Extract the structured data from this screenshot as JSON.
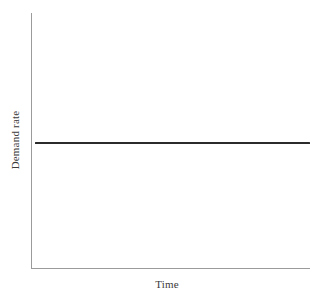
{
  "figure": {
    "background_color": "#ffffff",
    "axis_color": "#9b9b9b",
    "series_color": "#2b2b2b"
  },
  "axes": {
    "x_title": "Time",
    "y_title": "Demand rate"
  },
  "chart_data": {
    "type": "line",
    "title": "",
    "subtitle": "",
    "xlabel": "Time",
    "ylabel": "Demand rate",
    "xlim": [
      0,
      1
    ],
    "ylim": [
      0,
      1
    ],
    "x_tick_labels": [],
    "y_tick_labels": [],
    "grid": false,
    "legend": false,
    "legend_position": "none",
    "annotations": [],
    "series": [
      {
        "name": "Demand rate",
        "color": "#2b2b2b",
        "line_width": 2.6,
        "x": [
          0.01,
          1.0
        ],
        "values": [
          0.49,
          0.49
        ],
        "description": "Constant (flat) demand rate over time"
      }
    ]
  }
}
